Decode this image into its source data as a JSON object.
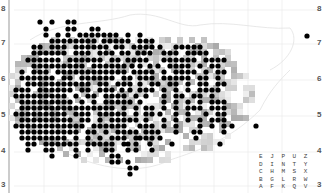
{
  "map": {
    "y_ticks_left": [
      "8",
      "7",
      "6",
      "5",
      "4",
      "3",
      "2"
    ],
    "y_ticks_right": [
      "8",
      "7",
      "6",
      "5",
      "4",
      "3",
      "2"
    ],
    "tick_y": [
      8,
      42,
      78,
      114,
      150,
      184,
      186
    ],
    "dot_color": "#000000",
    "grid_step": 6,
    "dot_rows": [
      {
        "y": 22,
        "xs": [
          40,
          52,
          68,
          74
        ]
      },
      {
        "y": 29,
        "xs": [
          46,
          68,
          74,
          92,
          98
        ]
      },
      {
        "y": 35,
        "xs": [
          46,
          58,
          68,
          80,
          86,
          92,
          98,
          104,
          110,
          116,
          128,
          140
        ]
      },
      {
        "y": 41,
        "xs": [
          52,
          58,
          64,
          70,
          76,
          82,
          88,
          94,
          104,
          110,
          116,
          122,
          128,
          140,
          146,
          152
        ]
      },
      {
        "y": 47,
        "xs": [
          34,
          40,
          52,
          58,
          64,
          76,
          82,
          88,
          94,
          100,
          106,
          116,
          122,
          134,
          140,
          146,
          152,
          160,
          176,
          182,
          188,
          194,
          200
        ]
      },
      {
        "y": 53,
        "xs": [
          34,
          40,
          46,
          52,
          58,
          64,
          76,
          82,
          88,
          100,
          106,
          112,
          122,
          128,
          138,
          144,
          150,
          164,
          170,
          176,
          188,
          194,
          200,
          206
        ]
      },
      {
        "y": 60,
        "xs": [
          28,
          34,
          40,
          46,
          52,
          58,
          70,
          76,
          82,
          88,
          94,
          100,
          112,
          118,
          128,
          134,
          140,
          146,
          164,
          170,
          176,
          182,
          188,
          194,
          206,
          212,
          218,
          224
        ]
      },
      {
        "y": 66,
        "xs": [
          34,
          40,
          46,
          52,
          58,
          64,
          70,
          76,
          82,
          94,
          100,
          106,
          112,
          118,
          124,
          132,
          140,
          150,
          158,
          170,
          176,
          182,
          188,
          200,
          212,
          218
        ]
      },
      {
        "y": 72,
        "xs": [
          22,
          34,
          40,
          46,
          58,
          64,
          70,
          76,
          82,
          88,
          94,
          100,
          106,
          112,
          118,
          124,
          134,
          140,
          146,
          152,
          164,
          176,
          182,
          188,
          194,
          206,
          218,
          224
        ]
      },
      {
        "y": 78,
        "xs": [
          22,
          28,
          34,
          40,
          46,
          52,
          64,
          70,
          82,
          88,
          94,
          100,
          106,
          112,
          124,
          130,
          140,
          146,
          152,
          164,
          170,
          176,
          182,
          188,
          200,
          206,
          218
        ]
      },
      {
        "y": 84,
        "xs": [
          28,
          34,
          40,
          46,
          52,
          58,
          64,
          70,
          76,
          82,
          88,
          100,
          106,
          118,
          124,
          130,
          140,
          152,
          158,
          170,
          176,
          188,
          200,
          206,
          218,
          224
        ]
      },
      {
        "y": 90,
        "xs": [
          16,
          22,
          28,
          40,
          46,
          52,
          58,
          64,
          70,
          82,
          88,
          100,
          106,
          112,
          122,
          130,
          140,
          146,
          152,
          164,
          176,
          188,
          200,
          206,
          212,
          218
        ]
      },
      {
        "y": 96,
        "xs": [
          16,
          22,
          28,
          34,
          40,
          46,
          52,
          58,
          64,
          76,
          88,
          94,
          106,
          112,
          118,
          124,
          136,
          146,
          164,
          176,
          182,
          194,
          200,
          212
        ]
      },
      {
        "y": 102,
        "xs": [
          22,
          28,
          34,
          40,
          46,
          52,
          58,
          64,
          70,
          82,
          94,
          106,
          112,
          118,
          124,
          130,
          140,
          164,
          176,
          188,
          200,
          212,
          218,
          224
        ]
      },
      {
        "y": 108,
        "xs": [
          22,
          28,
          34,
          40,
          46,
          52,
          58,
          64,
          70,
          76,
          82,
          88,
          94,
          100,
          106,
          112,
          124,
          136,
          146,
          152,
          164,
          176,
          188,
          194,
          200,
          212,
          218,
          224
        ]
      },
      {
        "y": 114,
        "xs": [
          16,
          22,
          28,
          34,
          40,
          46,
          52,
          58,
          64,
          76,
          82,
          88,
          100,
          106,
          112,
          118,
          124,
          136,
          146,
          152,
          160,
          176,
          188,
          206,
          218,
          224
        ]
      },
      {
        "y": 120,
        "xs": [
          22,
          28,
          34,
          40,
          46,
          52,
          58,
          64,
          70,
          82,
          88,
          100,
          112,
          118,
          124,
          130,
          136,
          146,
          164,
          176,
          188,
          200,
          212,
          218,
          224
        ]
      },
      {
        "y": 126,
        "xs": [
          16,
          22,
          28,
          34,
          40,
          46,
          52,
          58,
          64,
          70,
          76,
          82,
          94,
          100,
          106,
          112,
          118,
          124,
          140,
          146,
          152,
          164,
          176,
          200,
          212,
          224,
          232,
          256
        ]
      },
      {
        "y": 132,
        "xs": [
          22,
          28,
          34,
          40,
          46,
          52,
          58,
          64,
          70,
          76,
          88,
          94,
          106,
          118,
          124,
          130,
          136,
          146,
          152,
          158,
          176,
          194,
          200,
          224
        ]
      },
      {
        "y": 138,
        "xs": [
          22,
          28,
          34,
          40,
          46,
          52,
          58,
          64,
          76,
          88,
          100,
          112,
          118,
          124,
          136,
          140,
          146,
          152,
          160,
          196
        ]
      },
      {
        "y": 144,
        "xs": [
          28,
          34,
          46,
          52,
          58,
          64,
          70,
          76,
          88,
          94,
          100,
          106,
          112,
          124,
          128,
          136,
          150,
          172,
          220
        ]
      },
      {
        "y": 150,
        "xs": [
          28,
          46,
          52,
          76,
          88,
          106,
          112,
          128,
          136,
          152
        ]
      },
      {
        "y": 156,
        "xs": [
          52,
          76,
          112,
          118
        ]
      },
      {
        "y": 162,
        "xs": [
          112,
          118,
          128
        ]
      },
      {
        "y": 168,
        "xs": [
          130,
          136
        ]
      },
      {
        "y": 174,
        "xs": [
          130
        ]
      },
      {
        "y": 36,
        "xs": [
          307
        ]
      }
    ]
  },
  "legend": {
    "rows": [
      "E J P U Z",
      "D I N T Y",
      "C H M S X",
      "B G L R W",
      "A F K Q V"
    ]
  }
}
